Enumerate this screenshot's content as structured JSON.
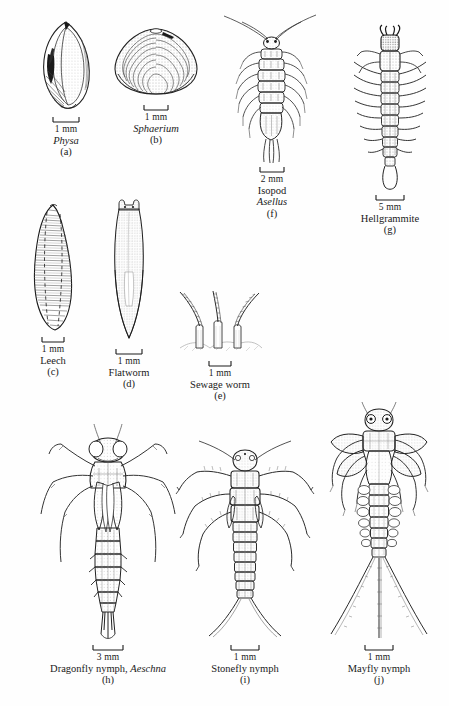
{
  "figure": {
    "background_color": "#fefefe",
    "ink_color": "#1a1a1a",
    "width": 449,
    "height": 706,
    "specimen_count": 10
  },
  "specimens": [
    {
      "id": "physa",
      "letter": "(a)",
      "common_name": "",
      "scientific_name": "Physa",
      "name_is_italic": true,
      "scale_label": "1 mm",
      "scale_bar_px": 26,
      "icon": "snail-shell-icon"
    },
    {
      "id": "sphaerium",
      "letter": "(b)",
      "common_name": "",
      "scientific_name": "Sphaerium",
      "name_is_italic": true,
      "scale_label": "1 mm",
      "scale_bar_px": 24,
      "icon": "clam-shell-icon"
    },
    {
      "id": "leech",
      "letter": "(c)",
      "common_name": "Leech",
      "scientific_name": "",
      "name_is_italic": false,
      "scale_label": "1 mm",
      "scale_bar_px": 22,
      "icon": "leech-icon"
    },
    {
      "id": "flatworm",
      "letter": "(d)",
      "common_name": "Flatworm",
      "scientific_name": "",
      "name_is_italic": false,
      "scale_label": "1 mm",
      "scale_bar_px": 26,
      "icon": "flatworm-icon"
    },
    {
      "id": "sewage-worm",
      "letter": "(e)",
      "common_name": "Sewage worm",
      "scientific_name": "",
      "name_is_italic": false,
      "scale_label": "1 mm",
      "scale_bar_px": 22,
      "icon": "sewage-worm-icon"
    },
    {
      "id": "isopod",
      "letter": "(f)",
      "common_name": "Isopod",
      "scientific_name": "Asellus",
      "name_is_italic": false,
      "scale_label": "2 mm",
      "scale_bar_px": 24,
      "icon": "isopod-icon"
    },
    {
      "id": "hellgrammite",
      "letter": "(g)",
      "common_name": "Hellgrammite",
      "scientific_name": "",
      "name_is_italic": false,
      "scale_label": "5 mm",
      "scale_bar_px": 30,
      "icon": "hellgrammite-icon"
    },
    {
      "id": "dragonfly-nymph",
      "letter": "(h)",
      "common_name": "Dragonfly nymph,",
      "scientific_name": "Aeschna",
      "name_is_italic": false,
      "scale_label": "3 mm",
      "scale_bar_px": 30,
      "icon": "dragonfly-nymph-icon"
    },
    {
      "id": "stonefly-nymph",
      "letter": "(i)",
      "common_name": "Stonefly nymph",
      "scientific_name": "",
      "name_is_italic": false,
      "scale_label": "1 mm",
      "scale_bar_px": 28,
      "icon": "stonefly-nymph-icon"
    },
    {
      "id": "mayfly-nymph",
      "letter": "(j)",
      "common_name": "Mayfly nymph",
      "scientific_name": "",
      "name_is_italic": false,
      "scale_label": "1 mm",
      "scale_bar_px": 28,
      "icon": "mayfly-nymph-icon"
    }
  ]
}
